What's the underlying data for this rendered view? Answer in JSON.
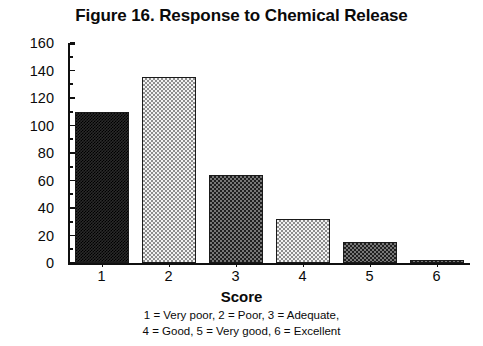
{
  "chart_data": {
    "type": "bar",
    "title": "Figure 16. Response to Chemical Release",
    "xlabel": "Score",
    "ylabel": "Number",
    "categories": [
      "1",
      "2",
      "3",
      "4",
      "5",
      "6"
    ],
    "values": [
      110,
      135,
      64,
      32,
      15,
      2
    ],
    "ylim": [
      0,
      160
    ],
    "yticks": [
      0,
      20,
      40,
      60,
      80,
      100,
      120,
      140,
      160
    ],
    "ytick_labels": [
      "0",
      "20",
      "40",
      "60",
      "80",
      "100",
      "120",
      "140",
      "160"
    ],
    "grid": false,
    "legend": false,
    "bar_fills": [
      "dark-stipple",
      "light-checker",
      "dark-checker",
      "light-checker",
      "dark-checker",
      "dark-checker"
    ],
    "annotations": [
      "1 = Very poor,  2 = Poor,  3 = Adequate,",
      "4 = Good,  5 = Very good,  6 = Excellent"
    ],
    "colors": {
      "axis": "#101010",
      "text": "#0a0a0a",
      "bar_dark": "#2a2a2a",
      "bar_light": "#f2f2f2",
      "background": "#ffffff"
    }
  },
  "caption": {
    "line1": "1 = Very poor,  2 = Poor,  3 = Adequate,",
    "line2": "4 = Good,  5 = Very good,  6 = Excellent"
  }
}
